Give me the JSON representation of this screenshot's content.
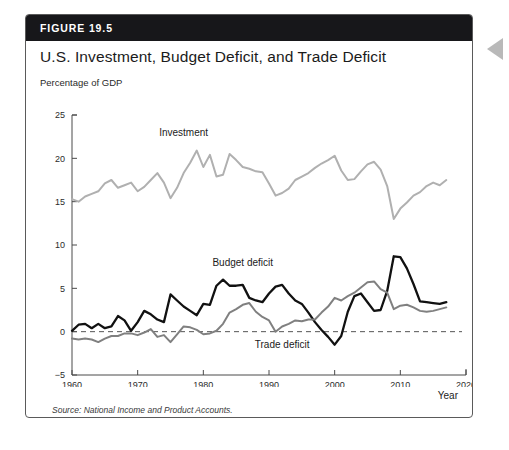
{
  "figure": {
    "number": "FIGURE 19.5",
    "title": "U.S. Investment, Budget Deficit, and Trade Deficit",
    "source": "Source: National Income and Product Accounts."
  },
  "colors": {
    "header_bg": "#17171a",
    "card_border": "#5a5a5a",
    "investment": "#b0b0b0",
    "budget_deficit": "#111111",
    "trade_deficit": "#808080",
    "zero_line": "#555555",
    "side_tab": "#b9b9b9"
  },
  "chart_data": {
    "type": "line",
    "title": "U.S. Investment, Budget Deficit, and Trade Deficit",
    "xlabel": "Year",
    "ylabel": "Percentage of GDP",
    "xlim": [
      1960,
      2020
    ],
    "ylim": [
      -5,
      25
    ],
    "xticks": [
      1960,
      1970,
      1980,
      1990,
      2000,
      2010,
      2020
    ],
    "yticks": [
      -5,
      0,
      5,
      10,
      15,
      20,
      25
    ],
    "grid": false,
    "legend": "inline-annotations",
    "zero_reference_line": 0,
    "annotations": [
      {
        "text": "Investment",
        "x": 1977,
        "y": 22.6
      },
      {
        "text": "Budget deficit",
        "x": 1986,
        "y": 7.6
      },
      {
        "text": "Trade deficit",
        "x": 1992,
        "y": -1.9
      }
    ],
    "x": [
      1960,
      1961,
      1962,
      1963,
      1964,
      1965,
      1966,
      1967,
      1968,
      1969,
      1970,
      1971,
      1972,
      1973,
      1974,
      1975,
      1976,
      1977,
      1978,
      1979,
      1980,
      1981,
      1982,
      1983,
      1984,
      1985,
      1986,
      1987,
      1988,
      1989,
      1990,
      1991,
      1992,
      1993,
      1994,
      1995,
      1996,
      1997,
      1998,
      1999,
      2000,
      2001,
      2002,
      2003,
      2004,
      2005,
      2006,
      2007,
      2008,
      2009,
      2010,
      2011,
      2012,
      2013,
      2014,
      2015,
      2016,
      2017
    ],
    "series": [
      {
        "name": "Investment",
        "color": "#b0b0b0",
        "values": [
          15.3,
          15.0,
          15.6,
          15.9,
          16.2,
          17.1,
          17.5,
          16.6,
          16.9,
          17.2,
          16.2,
          16.7,
          17.5,
          18.3,
          17.2,
          15.4,
          16.6,
          18.3,
          19.5,
          20.9,
          19.0,
          20.4,
          17.9,
          18.1,
          20.5,
          19.8,
          19.0,
          18.8,
          18.5,
          18.4,
          17.1,
          15.7,
          16.0,
          16.5,
          17.5,
          17.9,
          18.3,
          18.9,
          19.4,
          19.8,
          20.3,
          18.6,
          17.5,
          17.6,
          18.5,
          19.3,
          19.6,
          18.7,
          16.8,
          13.0,
          14.2,
          14.9,
          15.7,
          16.1,
          16.8,
          17.2,
          16.9,
          17.5
        ]
      },
      {
        "name": "Budget deficit",
        "color": "#111111",
        "values": [
          0.1,
          0.8,
          0.9,
          0.4,
          0.9,
          0.4,
          0.6,
          1.8,
          1.3,
          0.1,
          1.1,
          2.4,
          2.0,
          1.4,
          1.1,
          4.3,
          3.6,
          2.9,
          2.4,
          1.9,
          3.2,
          3.1,
          5.3,
          6.0,
          5.3,
          5.3,
          5.4,
          3.9,
          3.6,
          3.4,
          4.4,
          5.2,
          5.4,
          4.4,
          3.6,
          3.2,
          2.2,
          1.1,
          0.2,
          -0.6,
          -1.5,
          -0.5,
          2.3,
          4.1,
          4.4,
          3.4,
          2.4,
          2.5,
          4.7,
          8.7,
          8.6,
          7.3,
          5.5,
          3.5,
          3.4,
          3.3,
          3.2,
          3.4
        ]
      },
      {
        "name": "Trade deficit",
        "color": "#808080",
        "values": [
          -0.8,
          -0.9,
          -0.8,
          -0.9,
          -1.2,
          -0.8,
          -0.5,
          -0.5,
          -0.2,
          -0.2,
          -0.4,
          -0.1,
          0.3,
          -0.6,
          -0.4,
          -1.2,
          -0.3,
          0.6,
          0.5,
          0.2,
          -0.3,
          -0.2,
          0.1,
          0.9,
          2.2,
          2.6,
          3.1,
          3.3,
          2.3,
          1.7,
          1.3,
          0.0,
          0.6,
          0.9,
          1.3,
          1.2,
          1.4,
          1.4,
          2.2,
          2.9,
          3.9,
          3.6,
          4.1,
          4.5,
          5.1,
          5.7,
          5.8,
          4.9,
          4.5,
          2.6,
          3.0,
          3.1,
          2.8,
          2.4,
          2.3,
          2.4,
          2.6,
          2.8
        ]
      }
    ]
  },
  "axis": {
    "x_tick_labels": [
      "1960",
      "1970",
      "1980",
      "1990",
      "2000",
      "2010",
      "2020"
    ],
    "y_tick_labels": [
      "25",
      "20",
      "15",
      "10",
      "5",
      "0",
      "−5"
    ]
  }
}
